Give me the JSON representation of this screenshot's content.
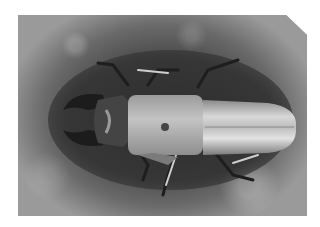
{
  "image": {
    "subject": "stag beetle",
    "style": "grayscale photograph",
    "view": "top-down",
    "background": "dark soil with lighter border",
    "colors": {
      "page_background": "#ffffff",
      "soil_dark": "#3c3c3c",
      "soil_light": "#9a9a9a",
      "beetle_body": "#a8a8a8",
      "beetle_highlight": "#e0e0e0",
      "mandibles": "#1c1c1c"
    }
  }
}
